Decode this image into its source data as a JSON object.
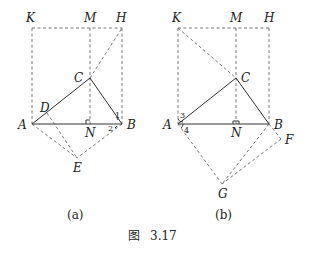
{
  "figure": {
    "caption": "图 3.17",
    "caption_prefix": "图",
    "caption_number": "3.17"
  },
  "panels": [
    {
      "id": "a",
      "sublabel": "(a)",
      "points": {
        "K": "K",
        "M": "M",
        "H": "H",
        "C": "C",
        "D": "D",
        "A": "A",
        "N": "N",
        "B": "B",
        "E": "E"
      },
      "angle_labels": [
        "1",
        "2"
      ]
    },
    {
      "id": "b",
      "sublabel": "(b)",
      "points": {
        "K": "K",
        "M": "M",
        "H": "H",
        "C": "C",
        "A": "A",
        "N": "N",
        "B": "B",
        "F": "F",
        "G": "G"
      },
      "angle_labels": [
        "3",
        "4"
      ]
    }
  ]
}
